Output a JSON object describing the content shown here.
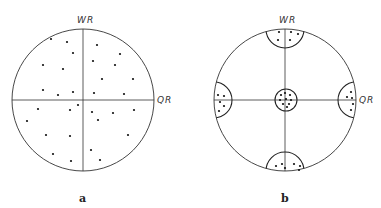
{
  "diagrams": [
    {
      "id": "a",
      "panel_label": "a",
      "vertical_axis_label": "WR",
      "horizontal_axis_label": "QR",
      "center": [
        83,
        100
      ],
      "radius": 71,
      "description": "Random scatter of points across the whole circle",
      "points": [
        [
          51,
          39
        ],
        [
          67,
          42
        ],
        [
          73,
          53
        ],
        [
          97,
          45
        ],
        [
          120,
          54
        ],
        [
          43,
          65
        ],
        [
          63,
          69
        ],
        [
          93,
          61
        ],
        [
          115,
          65
        ],
        [
          102,
          79
        ],
        [
          133,
          79
        ],
        [
          43,
          90
        ],
        [
          58,
          95
        ],
        [
          73,
          92
        ],
        [
          94,
          93
        ],
        [
          124,
          94
        ],
        [
          78,
          105
        ],
        [
          38,
          109
        ],
        [
          70,
          110
        ],
        [
          92,
          112
        ],
        [
          113,
          113
        ],
        [
          134,
          110
        ],
        [
          27,
          121
        ],
        [
          98,
          120
        ],
        [
          46,
          135
        ],
        [
          70,
          136
        ],
        [
          128,
          135
        ],
        [
          53,
          154
        ],
        [
          91,
          150
        ],
        [
          71,
          161
        ],
        [
          100,
          160
        ]
      ]
    },
    {
      "id": "b",
      "panel_label": "b",
      "vertical_axis_label": "WR",
      "horizontal_axis_label": "QR",
      "center": [
        285,
        100
      ],
      "radius": 71,
      "description": "Points clustered in small caps at the four axis ends and a small central circle",
      "central_circle": {
        "center": [
          286,
          100
        ],
        "radius": 11
      },
      "caps": [
        {
          "position": "top",
          "center": [
            285,
            29
          ],
          "radius": 19
        },
        {
          "position": "bottom",
          "center": [
            285,
            172
          ],
          "radius": 19
        },
        {
          "position": "left",
          "center": [
            214,
            100
          ],
          "radius": 18
        },
        {
          "position": "right",
          "center": [
            356,
            100
          ],
          "radius": 18
        }
      ],
      "points": [
        [
          279,
          32
        ],
        [
          291,
          32
        ],
        [
          298,
          34
        ],
        [
          278,
          40
        ],
        [
          290,
          40
        ],
        [
          276,
          166
        ],
        [
          282,
          164
        ],
        [
          294,
          164
        ],
        [
          300,
          166
        ],
        [
          285,
          168
        ],
        [
          299,
          170
        ],
        [
          218,
          95
        ],
        [
          224,
          96
        ],
        [
          220,
          102
        ],
        [
          224,
          106
        ],
        [
          219,
          111
        ],
        [
          351,
          92
        ],
        [
          352,
          98
        ],
        [
          347,
          97
        ],
        [
          353,
          104
        ],
        [
          351,
          110
        ],
        [
          281,
          95
        ],
        [
          285,
          93
        ],
        [
          290,
          95
        ],
        [
          280,
          100
        ],
        [
          286,
          99
        ],
        [
          291,
          100
        ],
        [
          283,
          104
        ],
        [
          289,
          104
        ],
        [
          287,
          107
        ]
      ]
    }
  ]
}
